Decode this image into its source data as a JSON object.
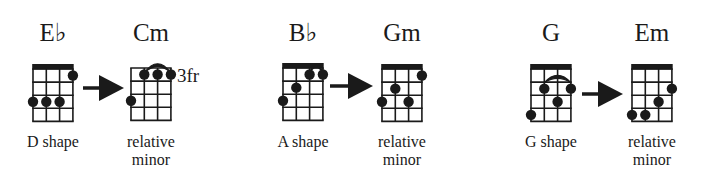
{
  "colors": {
    "ink": "#1a1a1a",
    "background": "#ffffff"
  },
  "pairs": [
    {
      "major": {
        "name": "E♭",
        "caption": [
          "D shape"
        ],
        "fret_label": "",
        "nut": true,
        "x": 33,
        "y": 64,
        "dots": [
          {
            "string": 4,
            "fret": 1
          },
          {
            "string": 1,
            "fret": 3
          },
          {
            "string": 2,
            "fret": 3
          },
          {
            "string": 3,
            "fret": 3
          }
        ],
        "barre": null
      },
      "arrow": {
        "x1": 83,
        "x2": 124,
        "y": 88,
        "head": 25,
        "half": 13
      },
      "minor": {
        "name": "Cm",
        "caption": [
          "relative",
          "minor"
        ],
        "fret_label": "3fr",
        "nut": false,
        "x": 131,
        "y": 68,
        "dots": [
          {
            "string": 2,
            "fret": 1
          },
          {
            "string": 3,
            "fret": 1
          },
          {
            "string": 4,
            "fret": 1
          },
          {
            "string": 1,
            "fret": 3
          }
        ],
        "barre": {
          "from": 2,
          "to": 4,
          "above": true
        }
      }
    },
    {
      "major": {
        "name": "B♭",
        "caption": [
          "A shape"
        ],
        "fret_label": "",
        "nut": true,
        "x": 283,
        "y": 63,
        "dots": [
          {
            "string": 3,
            "fret": 1
          },
          {
            "string": 4,
            "fret": 1
          },
          {
            "string": 2,
            "fret": 2
          },
          {
            "string": 1,
            "fret": 3
          }
        ],
        "barre": {
          "from": 3,
          "to": 4,
          "above": true
        }
      },
      "arrow": {
        "x1": 330,
        "x2": 373,
        "y": 86,
        "head": 25,
        "half": 13
      },
      "minor": {
        "name": "Gm",
        "caption": [
          "relative",
          "minor"
        ],
        "fret_label": "",
        "nut": true,
        "x": 382,
        "y": 64,
        "dots": [
          {
            "string": 4,
            "fret": 1
          },
          {
            "string": 2,
            "fret": 2
          },
          {
            "string": 1,
            "fret": 3
          },
          {
            "string": 3,
            "fret": 3
          }
        ],
        "barre": null
      }
    },
    {
      "major": {
        "name": "G",
        "caption": [
          "G shape"
        ],
        "fret_label": "",
        "nut": true,
        "x": 531,
        "y": 64,
        "dots": [
          {
            "string": 2,
            "fret": 2
          },
          {
            "string": 4,
            "fret": 2
          },
          {
            "string": 3,
            "fret": 3
          },
          {
            "string": 1,
            "fret": 4
          }
        ],
        "barre": {
          "from": 2,
          "to": 4,
          "above": false,
          "fret": 1
        }
      },
      "arrow": {
        "x1": 582,
        "x2": 623,
        "y": 94,
        "head": 25,
        "half": 13
      },
      "minor": {
        "name": "Em",
        "caption": [
          "relative",
          "minor"
        ],
        "fret_label": "",
        "nut": true,
        "x": 632,
        "y": 64,
        "dots": [
          {
            "string": 4,
            "fret": 2
          },
          {
            "string": 3,
            "fret": 3
          },
          {
            "string": 1,
            "fret": 4
          },
          {
            "string": 2,
            "fret": 4
          }
        ],
        "barre": null
      }
    }
  ],
  "layout": {
    "title_y": 20,
    "caption_y": 133,
    "string_spacing": 13.3,
    "fret_spacing": 13.1,
    "frets": 4,
    "dot_radius": 5.2
  }
}
